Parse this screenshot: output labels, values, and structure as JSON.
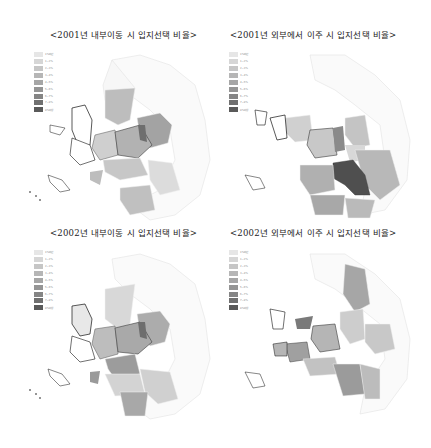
{
  "legend_labels": [
    "1%미만",
    "1~2%",
    "2~3%",
    "3~4%",
    "4~5%",
    "5~6%",
    "6~7%",
    "7~8%",
    "8%이상"
  ],
  "legend_colors": [
    "#e6e6e6",
    "#d6d6d6",
    "#c6c6c6",
    "#b6b6b6",
    "#a6a6a6",
    "#959595",
    "#858585",
    "#707070",
    "#5a5a5a"
  ],
  "panels": [
    {
      "title": "<2001년 내부이동 시 입지선택 비율>",
      "year": "2001",
      "type": "내부이동"
    },
    {
      "title": "<2001년 외부에서 이주 시 입지선택 비율>",
      "year": "2001",
      "type": "외부에서 이주"
    },
    {
      "title": "<2002년 내부이동 시 입지선택 비율>",
      "year": "2002",
      "type": "내부이동"
    },
    {
      "title": "<2002년 외부에서 이주 시 입지선택 비율>",
      "year": "2002",
      "type": "외부에서 이주"
    }
  ]
}
